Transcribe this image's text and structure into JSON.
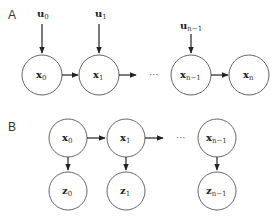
{
  "panels": {
    "A": {
      "label": "A",
      "nodes": [
        {
          "id": "x0",
          "base": "x",
          "sub": "0"
        },
        {
          "id": "x1",
          "base": "x",
          "sub": "1"
        },
        {
          "id": "xn1",
          "base": "x",
          "sub": "n−1"
        },
        {
          "id": "xn",
          "base": "x",
          "sub": "n"
        }
      ],
      "inputs": [
        {
          "id": "u0",
          "base": "u",
          "sub": "0"
        },
        {
          "id": "u1",
          "base": "u",
          "sub": "1"
        },
        {
          "id": "un1",
          "base": "u",
          "sub": "n−1"
        }
      ],
      "ellipsis": "···"
    },
    "B": {
      "label": "B",
      "top_nodes": [
        {
          "id": "x0",
          "base": "x",
          "sub": "0"
        },
        {
          "id": "x1",
          "base": "x",
          "sub": "1"
        },
        {
          "id": "xn1",
          "base": "x",
          "sub": "n−1"
        }
      ],
      "bottom_nodes": [
        {
          "id": "z0",
          "base": "z",
          "sub": "0"
        },
        {
          "id": "z1",
          "base": "z",
          "sub": "1"
        },
        {
          "id": "zn1",
          "base": "z",
          "sub": "n−1"
        }
      ],
      "ellipsis": "···"
    }
  },
  "colors": {
    "node_stroke": "#666666",
    "edge": "#222222",
    "background": "#ffffff"
  }
}
